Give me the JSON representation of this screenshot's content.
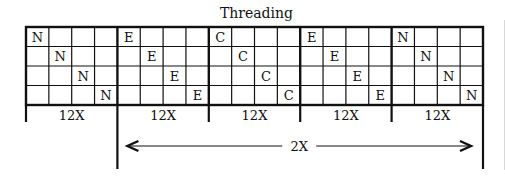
{
  "title": "Threading",
  "blocks": [
    {
      "letter": "N",
      "repeat": "12X"
    },
    {
      "letter": "E",
      "repeat": "12X"
    },
    {
      "letter": "C",
      "repeat": "12X"
    },
    {
      "letter": "E",
      "repeat": "12X"
    },
    {
      "letter": "N",
      "repeat": "12X"
    }
  ],
  "span_label": "2X",
  "grid": {
    "rows": 4,
    "cols_per_block": 4
  },
  "colors": {
    "line": "#111111",
    "background": "#ffffff"
  }
}
